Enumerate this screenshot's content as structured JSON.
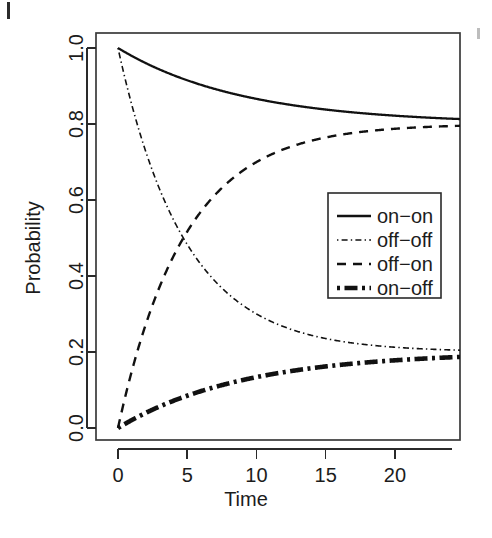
{
  "figure": {
    "background_color": "#ffffff",
    "ink_color": "#111111",
    "artifacts": [
      {
        "name": "page-edge-mark-left",
        "note": "short vertical scan mark, top-left corner"
      },
      {
        "name": "page-edge-mark-right",
        "note": "faint vertical scan mark, top-right margin"
      }
    ]
  },
  "chart_data": {
    "type": "line",
    "title": "",
    "subtitle": "",
    "xlabel": "Time",
    "ylabel": "Probability",
    "xlim": [
      0,
      24.7
    ],
    "ylim": [
      0.0,
      1.0
    ],
    "xticks": [
      0,
      5,
      10,
      15,
      20
    ],
    "xticklabels": [
      "0",
      "5",
      "10",
      "15",
      "20"
    ],
    "yticks": [
      0.0,
      0.2,
      0.4,
      0.6,
      0.8,
      1.0
    ],
    "yticklabels": [
      "0.0",
      "0.2",
      "0.4",
      "0.6",
      "0.8",
      "1.0"
    ],
    "grid": false,
    "frame": true,
    "legend_position": "upper-right",
    "legend_boxed": true,
    "annotations": [],
    "model_note": "Two-state Markov transition probabilities; stationary probabilities 0.8 (on) and 0.2 (off); relaxation rate lambda = 0.18 per unit time.",
    "x": [
      0,
      0.5,
      1,
      1.5,
      2,
      2.5,
      3,
      3.5,
      4,
      4.5,
      5,
      6,
      7,
      8,
      9,
      10,
      11,
      12,
      13,
      14,
      15,
      16,
      17,
      18,
      19,
      20,
      21,
      22,
      23,
      24,
      24.7
    ],
    "series": [
      {
        "name": "on-on",
        "label": "on−on",
        "linestyle": "solid",
        "linewidth": 2.3,
        "color": "#111111",
        "start_value": 1.0,
        "asymptote": 0.8,
        "values": [
          1.0,
          0.983,
          0.967,
          0.953,
          0.939,
          0.926,
          0.916,
          0.906,
          0.897,
          0.889,
          0.881,
          0.868,
          0.857,
          0.849,
          0.842,
          0.837,
          0.832,
          0.829,
          0.826,
          0.824,
          0.822,
          0.82,
          0.818,
          0.817,
          0.816,
          0.815,
          0.815,
          0.814,
          0.814,
          0.813,
          0.813
        ]
      },
      {
        "name": "off-off",
        "label": "off−off",
        "linestyle": "dotdash",
        "linewidth": 1.6,
        "color": "#111111",
        "start_value": 1.0,
        "asymptote": 0.2,
        "values": [
          1.0,
          0.931,
          0.868,
          0.811,
          0.758,
          0.71,
          0.666,
          0.625,
          0.588,
          0.554,
          0.523,
          0.468,
          0.423,
          0.385,
          0.353,
          0.327,
          0.304,
          0.285,
          0.269,
          0.256,
          0.244,
          0.234,
          0.226,
          0.219,
          0.213,
          0.208,
          0.204,
          0.2,
          0.197,
          0.195,
          0.193
        ]
      },
      {
        "name": "off-on",
        "label": "off−on",
        "linestyle": "dashed",
        "linewidth": 2.4,
        "color": "#111111",
        "start_value": 0.0,
        "asymptote": 0.8,
        "values": [
          0.0,
          0.069,
          0.132,
          0.189,
          0.242,
          0.29,
          0.334,
          0.375,
          0.412,
          0.446,
          0.477,
          0.532,
          0.577,
          0.615,
          0.647,
          0.673,
          0.696,
          0.715,
          0.731,
          0.744,
          0.756,
          0.766,
          0.774,
          0.781,
          0.787,
          0.792,
          0.796,
          0.8,
          0.803,
          0.805,
          0.807
        ]
      },
      {
        "name": "on-off",
        "label": "on−off",
        "linestyle": "dotdash-thick",
        "linewidth": 4.6,
        "color": "#111111",
        "start_value": 0.0,
        "asymptote": 0.2,
        "values": [
          0.0,
          0.017,
          0.033,
          0.047,
          0.061,
          0.074,
          0.084,
          0.094,
          0.103,
          0.111,
          0.119,
          0.132,
          0.143,
          0.151,
          0.158,
          0.163,
          0.168,
          0.171,
          0.174,
          0.176,
          0.178,
          0.18,
          0.182,
          0.183,
          0.184,
          0.185,
          0.185,
          0.186,
          0.186,
          0.187,
          0.187
        ]
      }
    ],
    "legend_entries": [
      {
        "label": "on−on",
        "linestyle": "solid"
      },
      {
        "label": "off−off",
        "linestyle": "dotdash"
      },
      {
        "label": "off−on",
        "linestyle": "dashed"
      },
      {
        "label": "on−off",
        "linestyle": "dotdash-thick"
      }
    ]
  }
}
